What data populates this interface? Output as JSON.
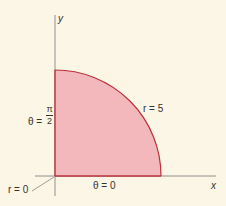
{
  "diagram": {
    "colors": {
      "background": "#fcf6e6",
      "region_fill": "#f2b8bc",
      "region_stroke": "#b8323c",
      "axis": "#777777",
      "text": "#333333"
    },
    "axes": {
      "x_label": "x",
      "y_label": "y"
    },
    "labels": {
      "theta_pi_half_prefix": "θ =",
      "theta_pi_half_num": "π",
      "theta_pi_half_den": "2",
      "r_zero": "r = 0",
      "theta_zero": "θ = 0",
      "r_five": "r = 5"
    },
    "region": {
      "r_min": 0,
      "r_max": 5,
      "theta_min": "0",
      "theta_max": "π/2"
    }
  }
}
